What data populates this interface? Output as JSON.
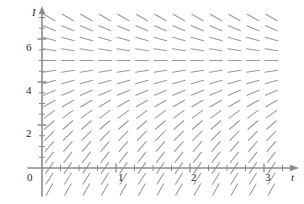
{
  "figure": {
    "title": "",
    "background_color": "#ffffff",
    "axis_color": "#8c8c8c",
    "segment_color": "#9a9a9a",
    "label_color": "#2b2b2b"
  },
  "axes": {
    "x_axis_label": "t",
    "y_axis_label": "I",
    "origin_label": "0",
    "x_ticks_major": [
      {
        "value": 1,
        "label": "1"
      },
      {
        "value": 2,
        "label": "2"
      },
      {
        "value": 3,
        "label": "3"
      }
    ],
    "y_ticks_major": [
      {
        "value": 2,
        "label": "2"
      },
      {
        "value": 4,
        "label": "4"
      },
      {
        "value": 6,
        "label": "6"
      }
    ],
    "x_minor_tick_step": 0.25,
    "y_minor_tick_step": 0.5,
    "x_range": [
      -0.1,
      3.35
    ],
    "y_range": [
      -1.2,
      7.6
    ]
  },
  "chart_data": {
    "type": "scatter",
    "subtype": "slope-field",
    "title": "",
    "xlabel": "t",
    "ylabel": "I",
    "xlim": [
      -0.1,
      3.35
    ],
    "ylim": [
      -1.2,
      7.6
    ],
    "grid": false,
    "legend": "none",
    "equilibrium_value": 5,
    "slope_rule": "dI/dt proportional to (5 - I)",
    "slope_constant": 1.0,
    "segment_half_length_px": 6.5,
    "x_samples": [
      0.1,
      0.35,
      0.6,
      0.85,
      1.1,
      1.35,
      1.6,
      1.85,
      2.1,
      2.35,
      2.6,
      2.85,
      3.1
    ],
    "y_samples": [
      -1.0,
      -0.5,
      0.0,
      0.5,
      1.0,
      1.5,
      2.0,
      2.5,
      3.0,
      3.5,
      4.0,
      4.5,
      5.0,
      5.5,
      6.0,
      6.5,
      7.0,
      7.5
    ],
    "annotations": [
      {
        "text": "horizontal segments along I = 5",
        "x": 1.6,
        "y": 5
      },
      {
        "text": "slopes positive below I = 5",
        "x": 1.6,
        "y": 2
      },
      {
        "text": "slopes negative above I = 5",
        "x": 1.6,
        "y": 6.5
      }
    ]
  }
}
